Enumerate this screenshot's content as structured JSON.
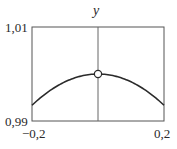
{
  "chart_data": {
    "type": "line",
    "title": "",
    "xlabel": "",
    "ylabel": "y",
    "xlim": [
      -0.2,
      0.2
    ],
    "ylim": [
      0.99,
      1.01
    ],
    "x_ticks": [
      "−0,2",
      "0,2"
    ],
    "y_ticks": [
      "0,99",
      "1,01"
    ],
    "grid": false,
    "function": "sin(x)/x",
    "series": [
      {
        "name": "y = sin x / x",
        "x": [
          -0.2,
          -0.15,
          -0.1,
          -0.05,
          0,
          0.05,
          0.1,
          0.15,
          0.2
        ],
        "values": [
          0.9933,
          0.9963,
          0.9983,
          0.9996,
          1.0,
          0.9996,
          0.9983,
          0.9963,
          0.9933
        ]
      }
    ],
    "annotations": [
      {
        "type": "open-circle",
        "x": 0,
        "y": 1.0,
        "note": "removable discontinuity at x = 0"
      },
      {
        "type": "vertical-axis-line",
        "x": 0
      }
    ]
  },
  "labels": {
    "y_axis": "y",
    "y_top": "1,01",
    "y_bottom": "0,99",
    "x_left": "−0,2",
    "x_right": "0,2"
  }
}
